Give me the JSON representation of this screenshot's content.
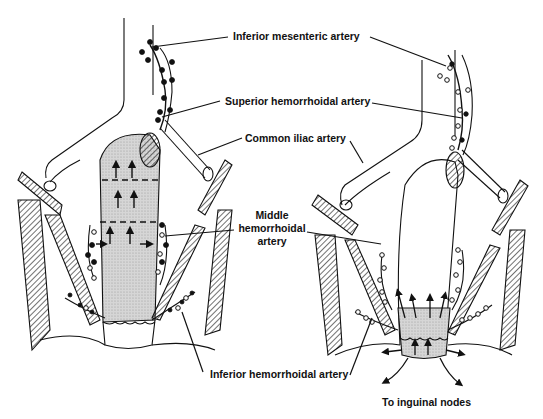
{
  "figure": {
    "panels": [
      {
        "id": "left",
        "content": "Rectum with upward lymph flow arrows; nodes along hemorrhoidal arteries"
      },
      {
        "id": "right",
        "content": "Anal canal with downward/lateral lymph flow arrows toward inguinal nodes"
      }
    ]
  },
  "labels": {
    "inferior_mesenteric": "Inferior mesenteric artery",
    "superior_hemorrhoidal": "Superior hemorrhoidal artery",
    "common_iliac": "Common iliac artery",
    "middle_hemorrhoidal_line1": "Middle",
    "middle_hemorrhoidal_line2": "hemorrhoidal",
    "middle_hemorrhoidal_line3": "artery",
    "inferior_hemorrhoidal": "Inferior hemorrhoidal artery",
    "to_inguinal": "To inguinal nodes"
  },
  "colors": {
    "ink": "#111111",
    "shade": "#cfcfcf",
    "background": "#ffffff"
  }
}
